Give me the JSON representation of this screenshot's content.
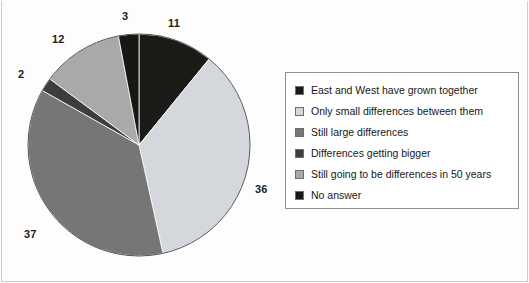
{
  "figure": {
    "background": "#fdfdfd",
    "frame_color": "#c9ccd1"
  },
  "chart_data": {
    "type": "pie",
    "title": "",
    "subtitle": "",
    "xlabel": "",
    "ylabel": "",
    "legend_position": "right",
    "grid": false,
    "units": "percent",
    "start_angle_deg": 0,
    "direction": "clockwise",
    "total": 101,
    "categories": [
      "East and West have grown together",
      "Only small differences between them",
      "Still large differences",
      "Differences getting bigger",
      "Still going to be differences in 50 years",
      "No answer"
    ],
    "values": [
      11,
      36,
      37,
      2,
      12,
      3
    ],
    "labels": [
      "11",
      "36",
      "37",
      "2",
      "12",
      "3"
    ],
    "colors": [
      "#1a1a16",
      "#d4d7db",
      "#767676",
      "#3d3d3d",
      "#a9a9a9",
      "#171714"
    ],
    "slices": [
      {
        "name": "East and West have grown together",
        "value": 11,
        "label": "11",
        "color": "#1a1a16",
        "label_x": 168,
        "label_y": 17
      },
      {
        "name": "Only small differences between them",
        "value": 36,
        "label": "36",
        "color": "#d4d7db",
        "label_x": 255,
        "label_y": 183
      },
      {
        "name": "Still large differences",
        "value": 37,
        "label": "37",
        "color": "#767676",
        "label_x": 24,
        "label_y": 228
      },
      {
        "name": "Differences getting bigger",
        "value": 2,
        "label": "2",
        "color": "#3d3d3d",
        "label_x": 18,
        "label_y": 68
      },
      {
        "name": "Still going to be differences in 50 years",
        "value": 12,
        "label": "12",
        "color": "#a9a9a9",
        "label_x": 52,
        "label_y": 33
      },
      {
        "name": "No answer",
        "value": 3,
        "label": "3",
        "color": "#171714",
        "label_x": 122,
        "label_y": 10
      }
    ],
    "geometry": {
      "center_x": 139,
      "center_y": 145,
      "radius": 111,
      "outline_color": "#555555"
    }
  },
  "legend": {
    "border_color": "#8d9197",
    "items": [
      {
        "label": "East and West have grown together",
        "color": "#1a1a16"
      },
      {
        "label": "Only small differences between them",
        "color": "#d4d7db"
      },
      {
        "label": "Still large differences",
        "color": "#767676"
      },
      {
        "label": "Differences getting bigger",
        "color": "#3d3d3d"
      },
      {
        "label": "Still going to be differences in 50 years",
        "color": "#a9a9a9"
      },
      {
        "label": "No answer",
        "color": "#171714"
      }
    ]
  }
}
